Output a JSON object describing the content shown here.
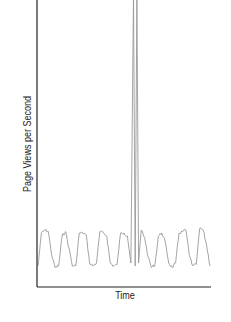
{
  "chart_data": {
    "type": "line",
    "title": "",
    "xlabel": "Time",
    "ylabel": "Page Views per Second",
    "grid": false,
    "legend": null,
    "series": [
      {
        "name": "page views",
        "color": "#9a9a9a",
        "x": [
          0,
          0.02,
          0.04,
          0.06,
          0.08,
          0.1,
          0.12,
          0.14,
          0.16,
          0.18,
          0.2,
          0.22,
          0.24,
          0.26,
          0.28,
          0.3,
          0.32,
          0.34,
          0.36,
          0.38,
          0.4,
          0.42,
          0.44,
          0.46,
          0.48,
          0.5,
          0.52,
          0.54,
          0.555,
          0.565,
          0.575,
          0.585,
          0.6,
          0.62,
          0.64,
          0.66,
          0.68,
          0.7,
          0.72,
          0.74,
          0.76,
          0.78,
          0.8,
          0.82,
          0.84,
          0.86,
          0.88,
          0.9,
          0.92,
          0.94,
          0.96,
          0.98,
          1.0
        ],
        "y": [
          8,
          30,
          32,
          31,
          15,
          7,
          8,
          28,
          31,
          20,
          8,
          8,
          30,
          30,
          29,
          10,
          8,
          10,
          31,
          30,
          28,
          10,
          8,
          9,
          30,
          30,
          28,
          10,
          100,
          8,
          100,
          10,
          32,
          27,
          14,
          7,
          9,
          28,
          30,
          24,
          10,
          7,
          10,
          30,
          31,
          32,
          15,
          8,
          9,
          33,
          32,
          22,
          8
        ]
      }
    ],
    "ylim": [
      0,
      100
    ],
    "xlim": [
      0,
      1
    ],
    "annotations": []
  }
}
